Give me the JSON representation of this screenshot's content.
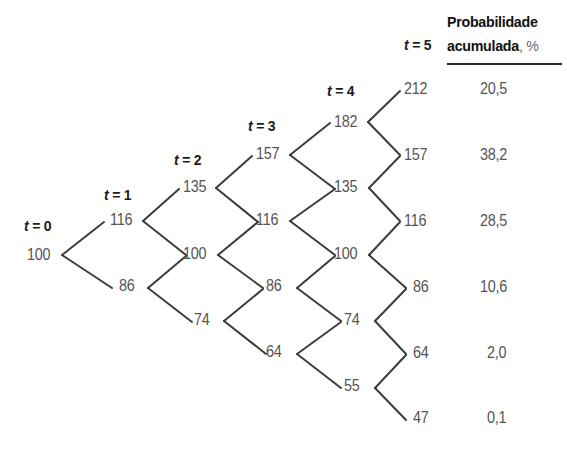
{
  "figure": {
    "type": "binomial-lattice-tree",
    "header": {
      "line1": "Probabilidade",
      "line2": "acumulada",
      "unit": ", %"
    },
    "time_labels": [
      {
        "id": "t0",
        "text": "t = 0",
        "t": 0,
        "x": 24,
        "y": 218
      },
      {
        "id": "t1",
        "text": "t = 1",
        "t": 1,
        "x": 104,
        "y": 187
      },
      {
        "id": "t2",
        "text": "t = 2",
        "t": 2,
        "x": 174,
        "y": 152
      },
      {
        "id": "t3",
        "text": "t = 3",
        "t": 3,
        "x": 248,
        "y": 118
      },
      {
        "id": "t4",
        "text": "t = 4",
        "t": 4,
        "x": 327,
        "y": 83
      },
      {
        "id": "t5",
        "text": "t = 5",
        "t": 5,
        "x": 404,
        "y": 37
      }
    ],
    "columns": [
      {
        "t": 0,
        "nodes": [
          {
            "value": "100",
            "x": 27,
            "y": 246
          }
        ]
      },
      {
        "t": 1,
        "nodes": [
          {
            "value": "116",
            "x": 110,
            "y": 211
          },
          {
            "value": "86",
            "x": 119,
            "y": 277
          }
        ]
      },
      {
        "t": 2,
        "nodes": [
          {
            "value": "135",
            "x": 183,
            "y": 178
          },
          {
            "value": "100",
            "x": 183,
            "y": 245
          },
          {
            "value": "74",
            "x": 194,
            "y": 311
          }
        ]
      },
      {
        "t": 3,
        "nodes": [
          {
            "value": "157",
            "x": 256,
            "y": 145
          },
          {
            "value": "116",
            "x": 256,
            "y": 211
          },
          {
            "value": "86",
            "x": 266,
            "y": 277
          },
          {
            "value": "64",
            "x": 266,
            "y": 343
          }
        ]
      },
      {
        "t": 4,
        "nodes": [
          {
            "value": "182",
            "x": 334,
            "y": 113
          },
          {
            "value": "135",
            "x": 334,
            "y": 178
          },
          {
            "value": "100",
            "x": 334,
            "y": 245
          },
          {
            "value": "74",
            "x": 344,
            "y": 311
          },
          {
            "value": "55",
            "x": 344,
            "y": 377
          }
        ]
      },
      {
        "t": 5,
        "nodes": [
          {
            "value": "212",
            "x": 404,
            "y": 80
          },
          {
            "value": "157",
            "x": 404,
            "y": 146
          },
          {
            "value": "116",
            "x": 404,
            "y": 212
          },
          {
            "value": "86",
            "x": 413,
            "y": 278
          },
          {
            "value": "64",
            "x": 413,
            "y": 344
          },
          {
            "value": "47",
            "x": 413,
            "y": 409
          }
        ]
      }
    ],
    "probabilities": [
      {
        "terminal": "212",
        "value": "20,5",
        "x": 480,
        "y": 80
      },
      {
        "terminal": "157",
        "value": "38,2",
        "x": 480,
        "y": 146
      },
      {
        "terminal": "116",
        "value": "28,5",
        "x": 480,
        "y": 212
      },
      {
        "terminal": "86",
        "value": "10,6",
        "x": 480,
        "y": 278
      },
      {
        "terminal": "64",
        "value": "2,0",
        "x": 487,
        "y": 344
      },
      {
        "terminal": "47",
        "value": "0,1",
        "x": 487,
        "y": 409
      }
    ],
    "edges": [
      {
        "x1": 62,
        "y1": 255,
        "x2": 104,
        "y2": 222
      },
      {
        "x1": 62,
        "y1": 255,
        "x2": 112,
        "y2": 288
      },
      {
        "x1": 143,
        "y1": 221,
        "x2": 179,
        "y2": 189
      },
      {
        "x1": 143,
        "y1": 221,
        "x2": 186,
        "y2": 255
      },
      {
        "x1": 148,
        "y1": 288,
        "x2": 186,
        "y2": 256
      },
      {
        "x1": 148,
        "y1": 288,
        "x2": 192,
        "y2": 322
      },
      {
        "x1": 216,
        "y1": 188,
        "x2": 252,
        "y2": 156
      },
      {
        "x1": 216,
        "y1": 188,
        "x2": 258,
        "y2": 222
      },
      {
        "x1": 218,
        "y1": 255,
        "x2": 258,
        "y2": 222
      },
      {
        "x1": 218,
        "y1": 255,
        "x2": 263,
        "y2": 288
      },
      {
        "x1": 224,
        "y1": 321,
        "x2": 263,
        "y2": 289
      },
      {
        "x1": 224,
        "y1": 321,
        "x2": 266,
        "y2": 354
      },
      {
        "x1": 290,
        "y1": 155,
        "x2": 330,
        "y2": 123
      },
      {
        "x1": 290,
        "y1": 155,
        "x2": 335,
        "y2": 189
      },
      {
        "x1": 290,
        "y1": 221,
        "x2": 335,
        "y2": 189
      },
      {
        "x1": 290,
        "y1": 221,
        "x2": 335,
        "y2": 255
      },
      {
        "x1": 297,
        "y1": 288,
        "x2": 335,
        "y2": 256
      },
      {
        "x1": 297,
        "y1": 288,
        "x2": 341,
        "y2": 321
      },
      {
        "x1": 297,
        "y1": 354,
        "x2": 341,
        "y2": 322
      },
      {
        "x1": 297,
        "y1": 354,
        "x2": 341,
        "y2": 388
      },
      {
        "x1": 368,
        "y1": 122,
        "x2": 400,
        "y2": 91
      },
      {
        "x1": 368,
        "y1": 122,
        "x2": 400,
        "y2": 155
      },
      {
        "x1": 369,
        "y1": 188,
        "x2": 400,
        "y2": 156
      },
      {
        "x1": 369,
        "y1": 188,
        "x2": 400,
        "y2": 221
      },
      {
        "x1": 369,
        "y1": 255,
        "x2": 400,
        "y2": 222
      },
      {
        "x1": 369,
        "y1": 255,
        "x2": 406,
        "y2": 288
      },
      {
        "x1": 375,
        "y1": 321,
        "x2": 406,
        "y2": 289
      },
      {
        "x1": 375,
        "y1": 321,
        "x2": 406,
        "y2": 354
      },
      {
        "x1": 375,
        "y1": 388,
        "x2": 406,
        "y2": 355
      },
      {
        "x1": 375,
        "y1": 388,
        "x2": 406,
        "y2": 420
      }
    ],
    "style": {
      "line_color": "#3c3c3c",
      "line_width": 2,
      "text_color": "#555555",
      "label_color": "#1b1b1b",
      "background": "#ffffff"
    },
    "header_rule": {
      "x": 447,
      "y": 63,
      "width": 115
    }
  }
}
